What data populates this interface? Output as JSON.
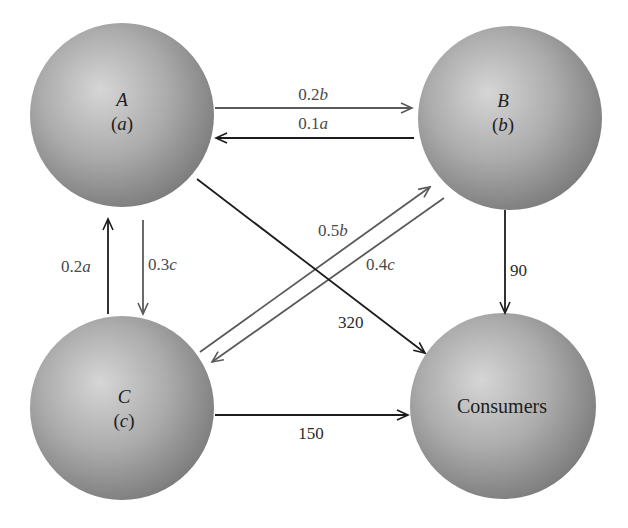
{
  "diagram": {
    "type": "flow-network",
    "nodes": [
      {
        "id": "A",
        "name": "A",
        "variable": "a"
      },
      {
        "id": "B",
        "name": "B",
        "variable": "b"
      },
      {
        "id": "C",
        "name": "C",
        "variable": "c"
      },
      {
        "id": "Consumers",
        "name": "Consumers",
        "variable": null
      }
    ],
    "edges": [
      {
        "from": "A",
        "to": "B",
        "coef": "0.2",
        "var": "b",
        "style": "gray"
      },
      {
        "from": "B",
        "to": "A",
        "coef": "0.1",
        "var": "a",
        "style": "dark"
      },
      {
        "from": "C",
        "to": "A",
        "coef": "0.2",
        "var": "a",
        "style": "dark"
      },
      {
        "from": "A",
        "to": "C",
        "coef": "0.3",
        "var": "c",
        "style": "gray"
      },
      {
        "from": "C",
        "to": "B",
        "coef": "0.5",
        "var": "b",
        "style": "gray"
      },
      {
        "from": "B",
        "to": "C",
        "coef": "0.4",
        "var": "c",
        "style": "gray"
      },
      {
        "from": "A",
        "to": "Consumers",
        "coef": "320",
        "var": "",
        "style": "dark"
      },
      {
        "from": "B",
        "to": "Consumers",
        "coef": "90",
        "var": "",
        "style": "dark"
      },
      {
        "from": "C",
        "to": "Consumers",
        "coef": "150",
        "var": "",
        "style": "dark"
      }
    ],
    "colors": {
      "sphere_highlight": "#d4d4d4",
      "sphere_mid": "#a8a8a8",
      "sphere_edge": "#7c7c7c",
      "arrow_dark": "#1c1c1c",
      "arrow_gray": "#5a5a5a"
    }
  }
}
